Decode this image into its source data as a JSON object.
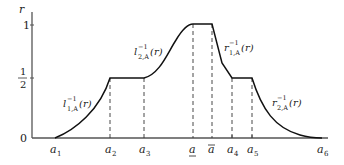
{
  "diagram": {
    "title": "",
    "y_axis": {
      "label": "r",
      "ticks": [
        {
          "label": "1",
          "value": 1
        },
        {
          "label_num": "1",
          "label_den": "2",
          "value": 0.5
        },
        {
          "label": "0",
          "value": 0
        }
      ]
    },
    "x_axis": {
      "ticks": [
        {
          "id": "a1",
          "base": "a",
          "sub": "1"
        },
        {
          "id": "a2",
          "base": "a",
          "sub": "2"
        },
        {
          "id": "a3",
          "base": "a",
          "sub": "3"
        },
        {
          "id": "a_lower",
          "base": "a",
          "decoration": "underline"
        },
        {
          "id": "a_upper",
          "base": "a",
          "decoration": "overline"
        },
        {
          "id": "a4",
          "base": "a",
          "sub": "4"
        },
        {
          "id": "a5",
          "base": "a",
          "sub": "5"
        },
        {
          "id": "a6",
          "base": "a",
          "sub": "6"
        }
      ]
    },
    "curve_labels": [
      {
        "id": "l1",
        "base": "l",
        "sup": "−1",
        "sub": "1,A",
        "arg": "(r)"
      },
      {
        "id": "l2",
        "base": "l",
        "sup": "−1",
        "sub": "2,A",
        "arg": "(r)"
      },
      {
        "id": "r1",
        "base": "r",
        "sup": "−1",
        "sub": "1,A",
        "arg": "(r)"
      },
      {
        "id": "r2",
        "base": "r",
        "sup": "−1",
        "sub": "2,A",
        "arg": "(r)"
      }
    ],
    "colors": {
      "axis": "#555555",
      "curve": "#111111",
      "dashed": "#333333"
    }
  }
}
